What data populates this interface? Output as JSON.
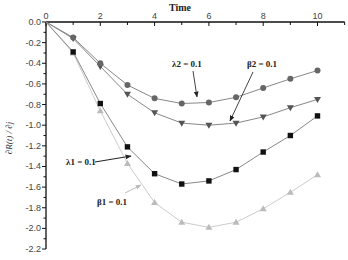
{
  "chart_data": {
    "type": "line",
    "title": "",
    "xlabel": "Time",
    "ylabel": "∂R(t) / ∂j",
    "xlim": [
      0,
      11
    ],
    "ylim": [
      -2.2,
      0.0
    ],
    "x_axis_position": "top",
    "grid": false,
    "x_ticks": [
      "0",
      "2",
      "4",
      "6",
      "8",
      "10"
    ],
    "y_ticks": [
      "0.0",
      "-0.2",
      "-0.4",
      "-0.6",
      "-0.8",
      "-1.0",
      "-1.2",
      "-1.4",
      "-1.6",
      "-1.8",
      "-2.0",
      "-2.2"
    ],
    "x": [
      0,
      1,
      2,
      3,
      4,
      5,
      6,
      7,
      8,
      9,
      10
    ],
    "series": [
      {
        "name": "λ2 = 0.1",
        "marker": "circle",
        "color": "#666666",
        "values": [
          0.0,
          -0.15,
          -0.4,
          -0.61,
          -0.74,
          -0.79,
          -0.78,
          -0.73,
          -0.64,
          -0.55,
          -0.47
        ]
      },
      {
        "name": "β2 = 0.1",
        "marker": "triangle-down",
        "color": "#555555",
        "values": [
          0.0,
          -0.16,
          -0.43,
          -0.7,
          -0.88,
          -0.98,
          -1.0,
          -0.98,
          -0.92,
          -0.83,
          -0.75
        ]
      },
      {
        "name": "λ1 = 0.1",
        "marker": "square",
        "color": "#111111",
        "values": [
          0.0,
          -0.29,
          -0.79,
          -1.21,
          -1.47,
          -1.57,
          -1.54,
          -1.43,
          -1.26,
          -1.1,
          -0.91
        ]
      },
      {
        "name": "β1 = 0.1",
        "marker": "triangle-up",
        "color": "#bbbbbb",
        "values": [
          0.0,
          -0.3,
          -0.86,
          -1.37,
          -1.75,
          -1.94,
          -1.99,
          -1.94,
          -1.81,
          -1.65,
          -1.48
        ]
      }
    ],
    "annotations": [
      {
        "text": "λ2 = 0.1",
        "points_to_series": 0
      },
      {
        "text": "β2 = 0.1",
        "points_to_series": 1
      },
      {
        "text": "λ1 = 0.1",
        "points_to_series": 2
      },
      {
        "text": "β1 = 0.1",
        "points_to_series": 3
      }
    ]
  }
}
